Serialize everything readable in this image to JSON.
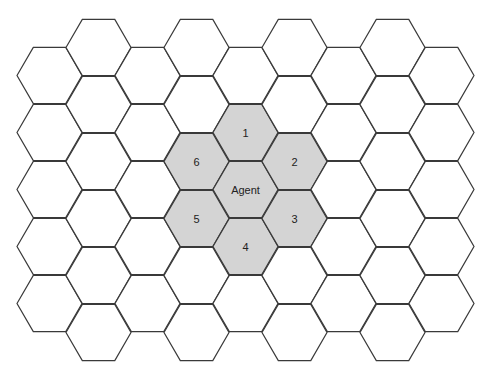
{
  "diagram": {
    "type": "hexagonal-grid",
    "orientation": "flat-top",
    "columns": 9,
    "rows_even_columns": 5,
    "rows_odd_columns": 6,
    "colors": {
      "stroke": "#3a3a3a",
      "shaded_fill": "#d4d4d4",
      "empty_fill": "#ffffff",
      "label": "#222222"
    },
    "geometry": {
      "side": 32.5,
      "col_step": 49,
      "row_step": 57,
      "first_col_center_x": 49.5,
      "even_col_first_center_y": 75.5,
      "odd_col_first_center_y": 47.5
    },
    "highlighted_cells": [
      {
        "col": 4,
        "row": 2,
        "label": "Agent"
      },
      {
        "col": 4,
        "row": 1,
        "label": "1"
      },
      {
        "col": 5,
        "row": 2,
        "label": "2"
      },
      {
        "col": 5,
        "row": 3,
        "label": "3"
      },
      {
        "col": 4,
        "row": 3,
        "label": "4"
      },
      {
        "col": 3,
        "row": 3,
        "label": "5"
      },
      {
        "col": 3,
        "row": 2,
        "label": "6"
      }
    ]
  }
}
